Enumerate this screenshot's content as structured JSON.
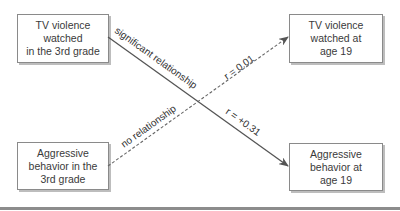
{
  "diagram": {
    "nodes": [
      {
        "id": "tv3",
        "lines": [
          "TV violence",
          "watched",
          "in the 3rd grade"
        ]
      },
      {
        "id": "tv19",
        "lines": [
          "TV violence",
          "watched at",
          "age 19"
        ]
      },
      {
        "id": "agg3",
        "lines": [
          "Aggressive",
          "behavior in the",
          "3rd grade"
        ]
      },
      {
        "id": "agg19",
        "lines": [
          "Aggressive",
          "behavior at",
          "age 19"
        ]
      }
    ],
    "edges": [
      {
        "from": "tv3",
        "to": "agg19",
        "style": "solid",
        "label_upper": "significant relationship",
        "label_lower": "r = +0.31"
      },
      {
        "from": "agg3",
        "to": "tv19",
        "style": "dashed",
        "label_upper": "r = 0.01",
        "label_lower": "no relationship"
      }
    ],
    "colors": {
      "line": "#555555",
      "box_border": "#8a8a8a",
      "shadow": "#bdbdbd",
      "rule": "#8c8c8c"
    }
  }
}
